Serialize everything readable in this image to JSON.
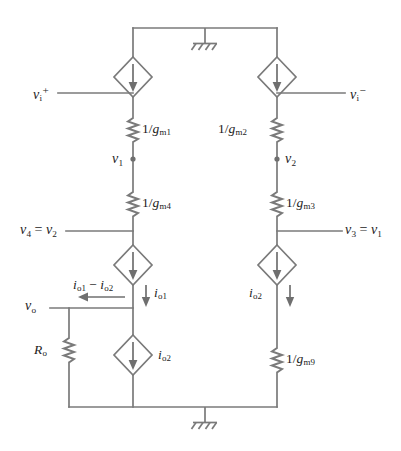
{
  "figure": {
    "name": "small-signal-equivalent-circuit",
    "background_color": "#ffffff",
    "line_color": "#7a7a7a",
    "text_color": "#1c1c1c"
  },
  "labels": {
    "input_plus": "v",
    "input_plus_sub": "i",
    "input_plus_sup": "+",
    "input_minus": "v",
    "input_minus_sub": "i",
    "input_minus_sup": "−",
    "node_v1": "v",
    "node_v1_sub": "1",
    "node_v2": "v",
    "node_v2_sub": "2",
    "v4_eq_v2_lead": "v",
    "v4_eq_v2_sub": "4",
    "v4_eq_v2_mid": " = ",
    "v4_eq_v2_tail": "v",
    "v4_eq_v2_tail_sub": "2",
    "v3_eq_v1_lead": "v",
    "v3_eq_v1_sub": "3",
    "v3_eq_v1_mid": " = ",
    "v3_eq_v1_tail": "v",
    "v3_eq_v1_tail_sub": "1",
    "v_out": "v",
    "v_out_sub": "o",
    "res_out": "R",
    "res_out_sub": "o"
  },
  "resistors": [
    {
      "id": "rm1",
      "numerator": "1/",
      "symbol": "g",
      "sub": "m1",
      "side": "right"
    },
    {
      "id": "rm2",
      "numerator": "1/",
      "symbol": "g",
      "sub": "m2",
      "side": "left"
    },
    {
      "id": "rm4",
      "numerator": "1/",
      "symbol": "g",
      "sub": "m4",
      "side": "right"
    },
    {
      "id": "rm3",
      "numerator": "1/",
      "symbol": "g",
      "sub": "m3",
      "side": "right"
    },
    {
      "id": "rm9",
      "numerator": "1/",
      "symbol": "g",
      "sub": "m9",
      "side": "right"
    }
  ],
  "currents": {
    "io1_minus_io2_a": "i",
    "io1_minus_io2_a_sub": "o1",
    "io1_minus_io2_op": " − ",
    "io1_minus_io2_b": "i",
    "io1_minus_io2_b_sub": "o2",
    "io1": "i",
    "io1_sub": "o1",
    "io2_left": "i",
    "io2_left_sub": "o2",
    "io2_right": "i",
    "io2_right_sub": "o2"
  },
  "sources": [
    {
      "id": "src-top-left",
      "type": "dependent-current-source",
      "direction": "down"
    },
    {
      "id": "src-top-right",
      "type": "dependent-current-source",
      "direction": "down"
    },
    {
      "id": "src-mid-left",
      "type": "dependent-current-source",
      "direction": "down"
    },
    {
      "id": "src-mid-right",
      "type": "dependent-current-source",
      "direction": "down"
    },
    {
      "id": "src-bottom-left",
      "type": "dependent-current-source",
      "direction": "down"
    }
  ],
  "grounds": [
    {
      "id": "ground-top",
      "style": "hatched"
    },
    {
      "id": "ground-bottom",
      "style": "hatched"
    }
  ]
}
